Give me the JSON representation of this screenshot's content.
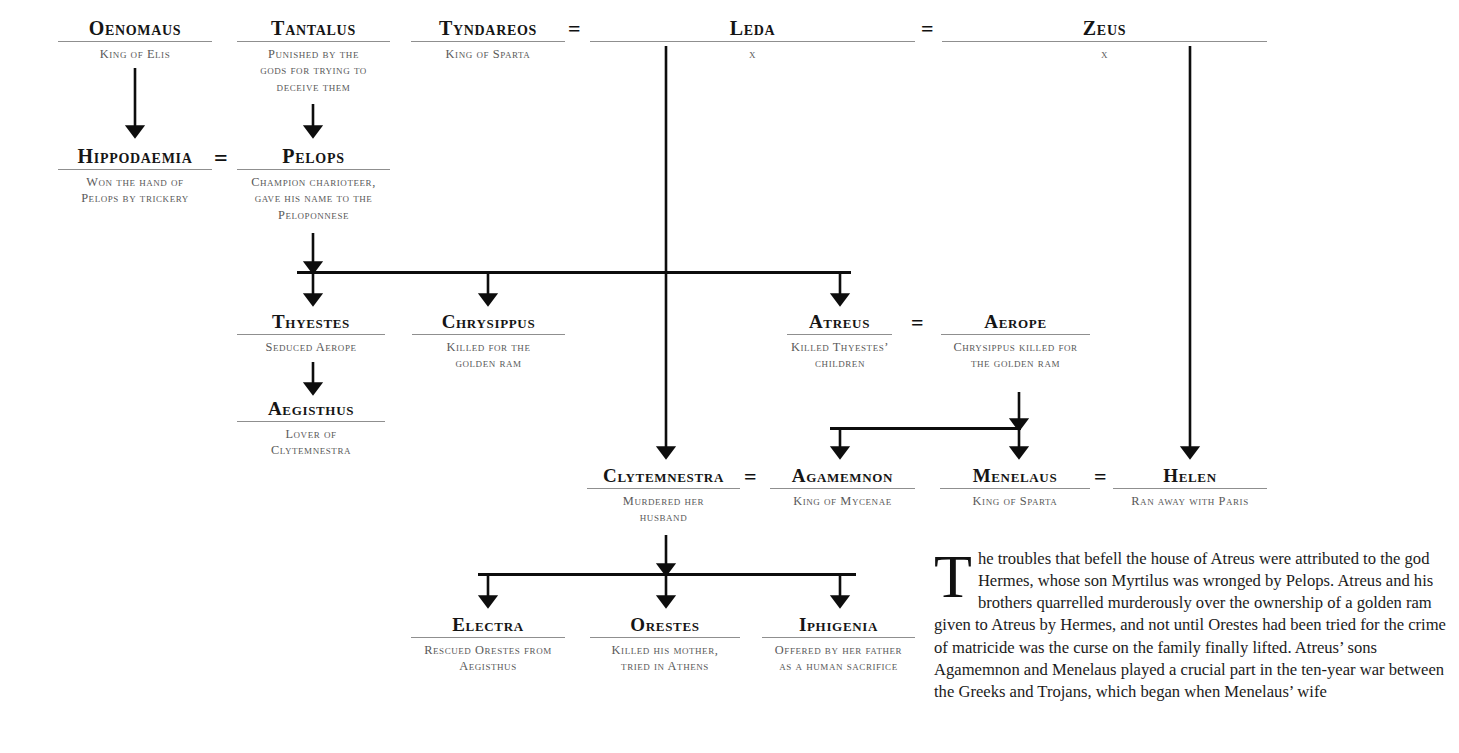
{
  "document": {
    "title": "The House of Atreus",
    "equals_symbol": "=",
    "unknown_marker": "x"
  },
  "nodes": {
    "oenomaus": {
      "name": "Oenomaus",
      "desc": "King of Elis"
    },
    "tantalus": {
      "name": "Tantalus",
      "desc": "Punished by the\ngods for trying to\ndeceive them"
    },
    "tyndareos": {
      "name": "Tyndareos",
      "desc": "King of Sparta"
    },
    "leda": {
      "name": "Leda",
      "desc": "x"
    },
    "zeus": {
      "name": "Zeus",
      "desc": "x"
    },
    "hippodaemia": {
      "name": "Hippodaemia",
      "desc": "Won the hand of\nPelops by trickery"
    },
    "pelops": {
      "name": "Pelops",
      "desc": "Champion charioteer,\ngave his name to the\nPeloponnese"
    },
    "thyestes": {
      "name": "Thyestes",
      "desc": "Seduced Aerope"
    },
    "chrysippus": {
      "name": "Chrysippus",
      "desc": "Killed for the\ngolden ram"
    },
    "atreus": {
      "name": "Atreus",
      "desc": "Killed Thyestes’\nchildren"
    },
    "aerope": {
      "name": "Aerope",
      "desc": "Chrysippus killed for\nthe golden ram"
    },
    "aegisthus": {
      "name": "Aegisthus",
      "desc": "Lover of\nClytemnestra"
    },
    "clytemnestra": {
      "name": "Clytemnestra",
      "desc": "Murdered her\nhusband"
    },
    "agamemnon": {
      "name": "Agamemnon",
      "desc": "King of Mycenae"
    },
    "menelaus": {
      "name": "Menelaus",
      "desc": "King of Sparta"
    },
    "helen": {
      "name": "Helen",
      "desc": "Ran away with Paris"
    },
    "electra": {
      "name": "Electra",
      "desc": "Rescued Orestes from\nAegisthus"
    },
    "orestes": {
      "name": "Orestes",
      "desc": "Killed his mother,\ntried in Athens"
    },
    "iphigenia": {
      "name": "Iphigenia",
      "desc": "Offered by her father\nas a human sacrifice"
    }
  },
  "marriages": [
    {
      "id": "tyndareos-leda",
      "symbol": "="
    },
    {
      "id": "leda-zeus",
      "symbol": "="
    },
    {
      "id": "hippodaemia-pelops",
      "symbol": "="
    },
    {
      "id": "atreus-aerope",
      "symbol": "="
    },
    {
      "id": "clytemnestra-agamemnon",
      "symbol": "="
    },
    {
      "id": "menelaus-helen",
      "symbol": "="
    }
  ],
  "story": {
    "dropcap": "T",
    "text": "he troubles that befell the house of Atreus were attributed to the god Hermes, whose son Myrtilus was wronged by Pelops. Atreus and his brothers quarrelled murderously over the ownership of a golden ram given to Atreus by Hermes, and not until Orestes had been tried for the crime of matricide was the curse on the family finally lifted. Atreus’ sons Agamemnon and Menelaus played a crucial part in the ten-year war between the Greeks and Trojans, which began when Menelaus’ wife"
  },
  "colors": {
    "name_text": "#151515",
    "desc_text": "#595959",
    "rule": "#8f8f8f",
    "connector": "#0d0d0d",
    "background": "#ffffff"
  }
}
